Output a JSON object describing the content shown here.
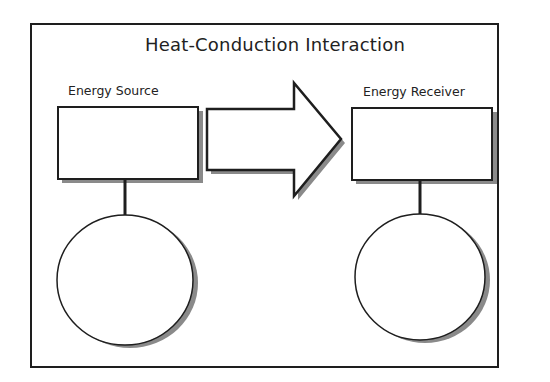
{
  "diagram": {
    "title": "Heat-Conduction Interaction",
    "source": {
      "label": "Energy Source",
      "box_text": "",
      "circle_text": ""
    },
    "receiver": {
      "label": "Energy Receiver",
      "box_text": "",
      "circle_text": ""
    },
    "arrow": {
      "direction": "right",
      "text": ""
    },
    "colors": {
      "stroke": "#1e1e1e",
      "fill": "#ffffff",
      "shadow": "#8a8a8a",
      "background": "#ffffff"
    }
  }
}
